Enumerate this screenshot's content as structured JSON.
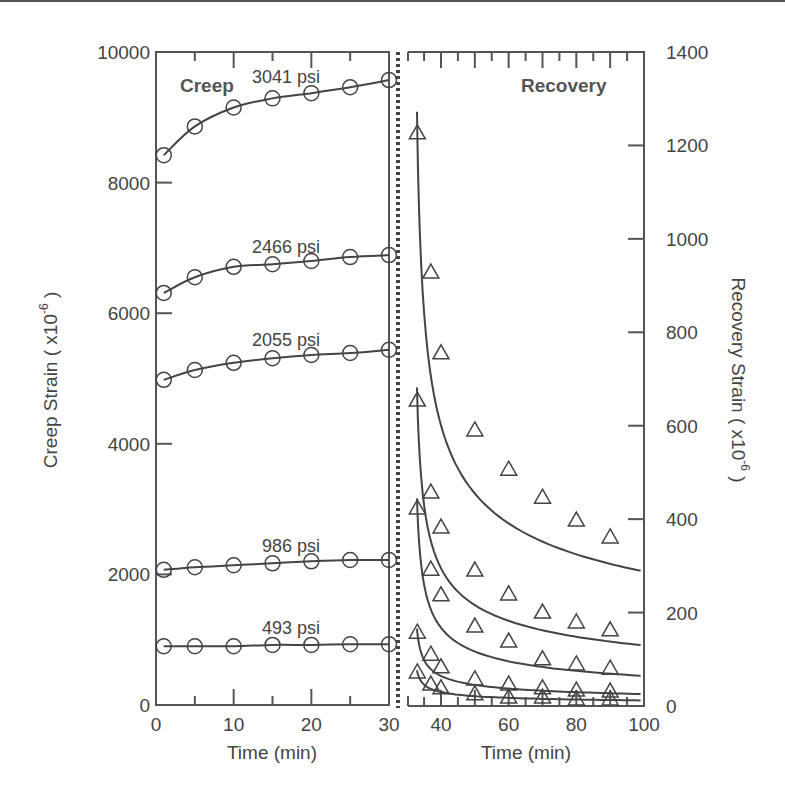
{
  "chart_data": [
    {
      "type": "line",
      "panel": "Creep",
      "title": "Creep",
      "xlabel": "Time (min)",
      "ylabel": "Creep Strain ( x10^-6 )",
      "xlim": [
        0,
        30
      ],
      "ylim": [
        0,
        10000
      ],
      "xticks": [
        0,
        10,
        20,
        30
      ],
      "yticks": [
        0,
        2000,
        4000,
        6000,
        8000,
        10000
      ],
      "grid": false,
      "marker": "circle",
      "x": [
        1,
        5,
        10,
        15,
        20,
        25,
        30
      ],
      "series": [
        {
          "name": "3041 psi",
          "values": [
            8420,
            8860,
            9150,
            9290,
            9370,
            9460,
            9570
          ]
        },
        {
          "name": "2466 psi",
          "values": [
            6310,
            6550,
            6710,
            6750,
            6800,
            6860,
            6890
          ]
        },
        {
          "name": "2055 psi",
          "values": [
            4980,
            5130,
            5240,
            5310,
            5360,
            5390,
            5440
          ]
        },
        {
          "name": "986 psi",
          "values": [
            2070,
            2110,
            2140,
            2170,
            2200,
            2220,
            2220
          ]
        },
        {
          "name": "493 psi",
          "values": [
            900,
            900,
            900,
            920,
            920,
            930,
            930
          ]
        }
      ]
    },
    {
      "type": "line",
      "panel": "Recovery",
      "title": "Recovery",
      "xlabel": "Time (min)",
      "ylabel": "Recovery Strain ( x10^-6 )",
      "xlim": [
        30,
        100
      ],
      "ylim": [
        0,
        1400
      ],
      "xticks": [
        40,
        60,
        80,
        100
      ],
      "yticks": [
        0,
        200,
        400,
        600,
        800,
        1000,
        1200,
        1400
      ],
      "grid": false,
      "marker": "triangle",
      "x": [
        33,
        37,
        40,
        50,
        60,
        70,
        80,
        90
      ],
      "series": [
        {
          "name": "3041 psi",
          "values": [
            1227,
            929,
            756,
            591,
            507,
            447,
            398,
            362
          ]
        },
        {
          "name": "2466 psi",
          "values": [
            655,
            458,
            383,
            291,
            240,
            201,
            180,
            163
          ]
        },
        {
          "name": "2055 psi",
          "values": [
            424,
            293,
            238,
            171,
            139,
            101,
            90,
            81
          ]
        },
        {
          "name": "986 psi",
          "values": [
            158,
            111,
            84,
            58,
            47,
            39,
            34,
            32
          ]
        },
        {
          "name": "493 psi",
          "values": [
            73,
            47,
            39,
            26,
            19,
            19,
            15,
            15
          ]
        }
      ]
    }
  ],
  "labels": {
    "creep_panel": "Creep",
    "recovery_panel": "Recovery",
    "left_xlabel": "Time (min)",
    "right_xlabel": "Time (min)",
    "left_ylabel": "Creep Strain ( x10",
    "right_ylabel": "Recovery Strain ( x10",
    "exponent": "-6",
    "close_paren": " )",
    "series_labels": [
      "3041 psi",
      "2466 psi",
      "2055 psi",
      "986 psi",
      "493 psi"
    ]
  },
  "colors": {
    "ink": "#444444",
    "axis": "#555555",
    "background": "#ffffff"
  }
}
